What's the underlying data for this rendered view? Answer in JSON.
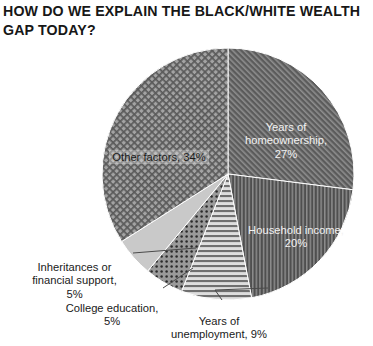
{
  "title": "HOW DO WE EXPLAIN THE BLACK/WHITE WEALTH GAP TODAY?",
  "chart_data": {
    "type": "pie",
    "title": "HOW DO WE EXPLAIN THE BLACK/WHITE WEALTH GAP TODAY?",
    "xlabel": "",
    "ylabel": "",
    "legend_position": "none",
    "grid": false,
    "units": "percent",
    "total": 100,
    "start_angle_deg": 0,
    "direction": "clockwise",
    "categories": [
      "Years of homeownership",
      "Household income",
      "Years of unemployment",
      "College education",
      "Inheritances or financial support",
      "Other factors"
    ],
    "values": [
      27,
      20,
      9,
      5,
      5,
      34
    ],
    "slices": [
      {
        "name": "Years of homeownership",
        "value": 27,
        "label": "Years of\nhomeownership,\n27%",
        "pattern": "diagonal-hatch",
        "base_color": "#5b5b5b",
        "pattern_color": "#8e8e8e",
        "text_color": "#f2f2f2"
      },
      {
        "name": "Household income",
        "value": 20,
        "label": "Household income,\n20%",
        "pattern": "vertical-stripes",
        "base_color": "#4f4f4f",
        "pattern_color": "#8c8c8c",
        "text_color": "#f2f2f2"
      },
      {
        "name": "Years of unemployment",
        "value": 9,
        "label": "Years of\nunemployment, 9%",
        "pattern": "horizontal-stripes",
        "base_color": "#d8d8d8",
        "pattern_color": "#6f6f6f",
        "text_color": "#1a1a1a"
      },
      {
        "name": "College education",
        "value": 5,
        "label": "College education,\n5%",
        "pattern": "dots",
        "base_color": "#9a9a9a",
        "pattern_color": "#2b2b2b",
        "text_color": "#1a1a1a"
      },
      {
        "name": "Inheritances or financial support",
        "value": 5,
        "label": "Inheritances or\nfinancial support,\n5%",
        "pattern": "solid-light",
        "base_color": "#c9c9c9",
        "pattern_color": "#c9c9c9",
        "text_color": "#1a1a1a"
      },
      {
        "name": "Other factors",
        "value": 34,
        "label": "Other factors, 34%",
        "pattern": "cross-hatch",
        "base_color": "#9b9b9b",
        "pattern_color": "#5a5a5a",
        "text_color": "#1c1c1c"
      }
    ]
  },
  "geometry": {
    "center_x": 228,
    "center_y": 174,
    "radius": 126
  }
}
